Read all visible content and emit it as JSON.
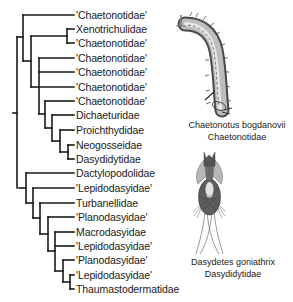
{
  "tree": {
    "taxa": [
      {
        "label": "'Chaetonotidae'",
        "y": 15,
        "x0": 23
      },
      {
        "label": "Xenotrichulidae",
        "y": 29,
        "x0": 67
      },
      {
        "label": "'Chaetonotidae'",
        "y": 43,
        "x0": 67
      },
      {
        "label": "'Chaetonotidae'",
        "y": 58,
        "x0": 39
      },
      {
        "label": "'Chaetonotidae'",
        "y": 72,
        "x0": 39
      },
      {
        "label": "'Chaetonotidae'",
        "y": 87,
        "x0": 39
      },
      {
        "label": "'Chaetonotidae'",
        "y": 101,
        "x0": 45
      },
      {
        "label": "Dichaeturidae",
        "y": 115,
        "x0": 52
      },
      {
        "label": "Proichthydidae",
        "y": 130,
        "x0": 60
      },
      {
        "label": "Neogosseidae",
        "y": 145,
        "x0": 68
      },
      {
        "label": "Dasydidytidae",
        "y": 159,
        "x0": 68
      },
      {
        "label": "Dactylopodolidae",
        "y": 173,
        "x0": 26
      },
      {
        "label": "'Lepidodasyidae'",
        "y": 188,
        "x0": 33
      },
      {
        "label": "Turbanellidae",
        "y": 203,
        "x0": 40
      },
      {
        "label": "'Planodasyidae'",
        "y": 217,
        "x0": 48
      },
      {
        "label": "Macrodasyidae",
        "y": 232,
        "x0": 55
      },
      {
        "label": "'Lepidodasyidae'",
        "y": 246,
        "x0": 55
      },
      {
        "label": "'Planodasyidae'",
        "y": 260,
        "x0": 63
      },
      {
        "label": "'Lepidodasyidae'",
        "y": 275,
        "x0": 70
      },
      {
        "label": "Thaumastodermatidae",
        "y": 289,
        "x0": 70
      }
    ],
    "tip_x": 74,
    "label_x": 76,
    "line_color": "#1a1a1a",
    "nodes": [
      {
        "x": 67,
        "y1": 29,
        "y2": 43,
        "parent_x": 31,
        "py": 36
      },
      {
        "x": 68,
        "y1": 145,
        "y2": 159,
        "parent_x": 60,
        "py": 152
      },
      {
        "x": 60,
        "y1": 130,
        "y2": 152,
        "parent_x": 52,
        "py": 141
      },
      {
        "x": 52,
        "y1": 115,
        "y2": 141,
        "parent_x": 45,
        "py": 128
      },
      {
        "x": 45,
        "y1": 101,
        "y2": 128,
        "parent_x": 39,
        "py": 114
      },
      {
        "x": 39,
        "y1": 58,
        "y2": 114,
        "parent_x": 31,
        "py": 87
      },
      {
        "x": 31,
        "y1": 36,
        "y2": 87,
        "parent_x": 23,
        "py": 61
      },
      {
        "x": 23,
        "y1": 15,
        "y2": 61,
        "parent_x": 17,
        "py": 37
      },
      {
        "x": 70,
        "y1": 275,
        "y2": 289,
        "parent_x": 63,
        "py": 282
      },
      {
        "x": 63,
        "y1": 260,
        "y2": 282,
        "parent_x": 55,
        "py": 271
      },
      {
        "x": 55,
        "y1": 232,
        "y2": 271,
        "parent_x": 48,
        "py": 251
      },
      {
        "x": 48,
        "y1": 217,
        "y2": 251,
        "parent_x": 40,
        "py": 234
      },
      {
        "x": 40,
        "y1": 203,
        "y2": 234,
        "parent_x": 33,
        "py": 218
      },
      {
        "x": 33,
        "y1": 188,
        "y2": 218,
        "parent_x": 26,
        "py": 203
      },
      {
        "x": 26,
        "y1": 173,
        "y2": 203,
        "parent_x": 19,
        "py": 188
      },
      {
        "x": 17,
        "y1": 37,
        "y2": 188,
        "parent_x": 13,
        "py": 113
      }
    ]
  },
  "illustrations": [
    {
      "name": "chaetonotus-drawing",
      "caption_species": "Chaetonotus bogdanovii",
      "caption_family": "Chaetonotidae"
    },
    {
      "name": "dasydetes-drawing",
      "caption_species": "Dasydetes goniathrix",
      "caption_family": "Dasydidytidae"
    }
  ]
}
